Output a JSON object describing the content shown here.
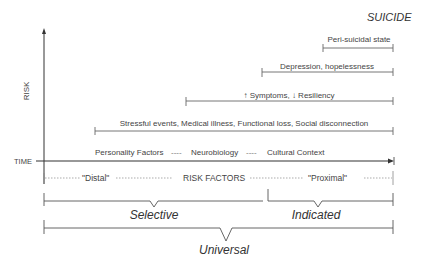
{
  "title": "SUICIDE",
  "axes": {
    "y_label": "RISK",
    "x_label": "TIME"
  },
  "bars": [
    {
      "label": "Peri-suicidal state",
      "x_start": 323,
      "x_end": 393,
      "y": 45
    },
    {
      "label": "Depression, hopelessness",
      "x_start": 262,
      "x_end": 393,
      "y": 72
    },
    {
      "label": "↑ Symptoms, ↓ Resiliency",
      "x_start": 186,
      "x_end": 393,
      "y": 101
    },
    {
      "label": "Stressful events, Medical illness, Functional loss, Social disconnection",
      "x_start": 95,
      "x_end": 393,
      "y": 131
    }
  ],
  "baseline_factors": {
    "items": [
      "Personality Factors",
      "Neurobiology",
      "Cultural Context"
    ],
    "separator": "----"
  },
  "risk_factor_row": {
    "left": "\"Distal\"",
    "center": "RISK FACTORS",
    "right": "\"Proximal\""
  },
  "interventions": {
    "selective": "Selective",
    "indicated": "Indicated",
    "universal": "Universal"
  },
  "colors": {
    "line": "#555555",
    "axis": "#333333",
    "text": "#444444"
  }
}
